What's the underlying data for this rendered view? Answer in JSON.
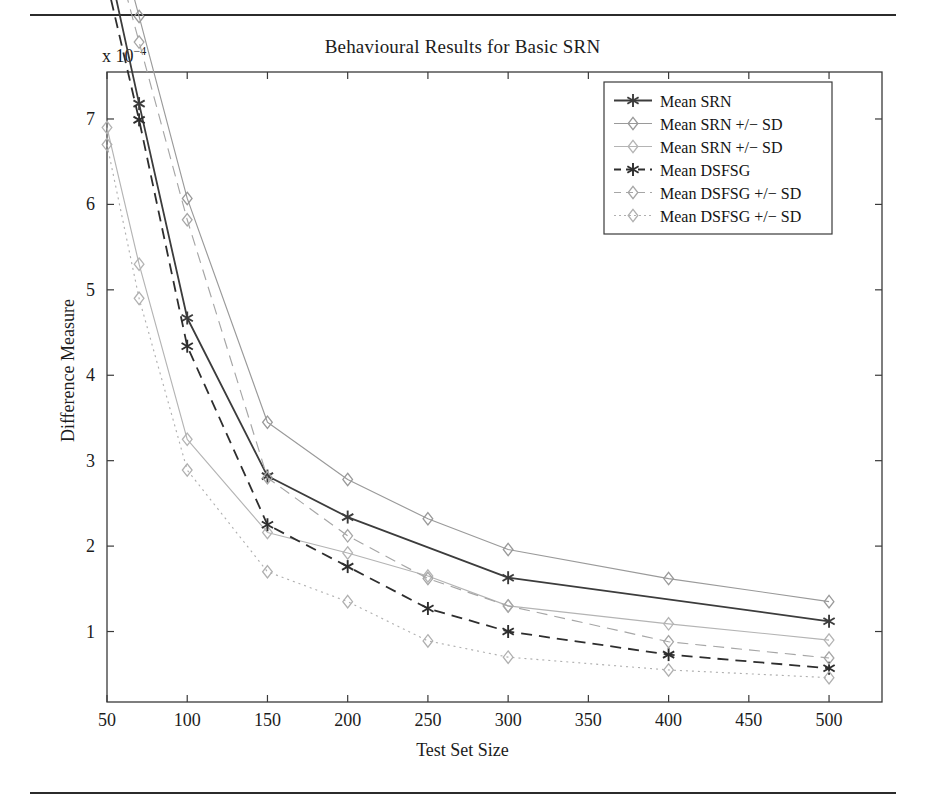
{
  "figure": {
    "title": "Behavioural Results for Basic SRN",
    "exponent_label": "x 10",
    "exponent_power": "−4",
    "xlabel": "Test Set Size",
    "ylabel": "Difference Measure"
  },
  "axes": {
    "x_ticks": [
      50,
      100,
      150,
      200,
      250,
      300,
      350,
      400,
      450,
      500
    ],
    "y_ticks": [
      1,
      2,
      3,
      4,
      5,
      6,
      7
    ],
    "xlim": [
      50,
      533
    ],
    "ylim": [
      0.175,
      7.55
    ],
    "grid": false
  },
  "legend": {
    "position": "top-right",
    "entries": [
      {
        "label": "Mean SRN",
        "marker": "asterisk",
        "style": "solid",
        "color": "#3c3c3c"
      },
      {
        "label": "Mean SRN +/− SD",
        "marker": "diamond",
        "style": "solid",
        "color": "#9a9a9a"
      },
      {
        "label": "Mean SRN +/− SD",
        "marker": "diamond",
        "style": "solid",
        "color": "#b4b4b4"
      },
      {
        "label": "Mean DSFSG",
        "marker": "asterisk",
        "style": "dashed",
        "color": "#2e2e2e"
      },
      {
        "label": "Mean DSFSG +/− SD",
        "marker": "diamond",
        "style": "dashed",
        "color": "#a6a6a6"
      },
      {
        "label": "Mean DSFSG +/− SD",
        "marker": "diamond",
        "style": "dotted",
        "color": "#b0b0b0"
      }
    ]
  },
  "chart_data": {
    "type": "line",
    "title": "Behavioural Results for Basic SRN",
    "xlabel": "Test Set Size",
    "ylabel": "Difference Measure",
    "y_scale_note": "x 10^-4",
    "x": [
      50,
      70,
      100,
      150,
      200,
      250,
      300,
      400,
      500
    ],
    "xlim": [
      50,
      533
    ],
    "ylim": [
      0.175,
      7.55
    ],
    "grid": false,
    "legend_position": "top-right",
    "series": [
      {
        "name": "Mean SRN",
        "marker": "asterisk",
        "style": "solid",
        "color": "#3c3c3c",
        "values": [
          8.9,
          7.18,
          4.67,
          2.82,
          2.34,
          null,
          1.63,
          null,
          1.12
        ]
      },
      {
        "name": "Mean SRN +/- SD (upper)",
        "marker": "diamond",
        "style": "solid",
        "color": "#9a9a9a",
        "values": [
          9.6,
          8.2,
          6.07,
          3.45,
          2.78,
          2.32,
          1.96,
          1.62,
          1.35
        ]
      },
      {
        "name": "Mean SRN +/- SD (lower)",
        "marker": "diamond",
        "style": "solid",
        "color": "#b4b4b4",
        "values": [
          6.9,
          5.3,
          3.25,
          2.16,
          1.92,
          1.65,
          1.3,
          1.09,
          0.9
        ]
      },
      {
        "name": "Mean DSFSG",
        "marker": "asterisk",
        "style": "dashed",
        "color": "#2e2e2e",
        "values": [
          8.6,
          6.99,
          4.34,
          2.25,
          1.76,
          1.27,
          1.0,
          0.73,
          0.57
        ]
      },
      {
        "name": "Mean DSFSG +/- SD (upper)",
        "marker": "diamond",
        "style": "dashed",
        "color": "#a6a6a6",
        "values": [
          9.3,
          7.9,
          5.82,
          2.8,
          2.12,
          1.62,
          1.3,
          0.88,
          0.69
        ]
      },
      {
        "name": "Mean DSFSG +/- SD (lower)",
        "marker": "diamond",
        "style": "dotted",
        "color": "#b0b0b0",
        "values": [
          6.7,
          4.9,
          2.89,
          1.7,
          1.35,
          0.89,
          0.7,
          0.55,
          0.46
        ]
      }
    ]
  }
}
